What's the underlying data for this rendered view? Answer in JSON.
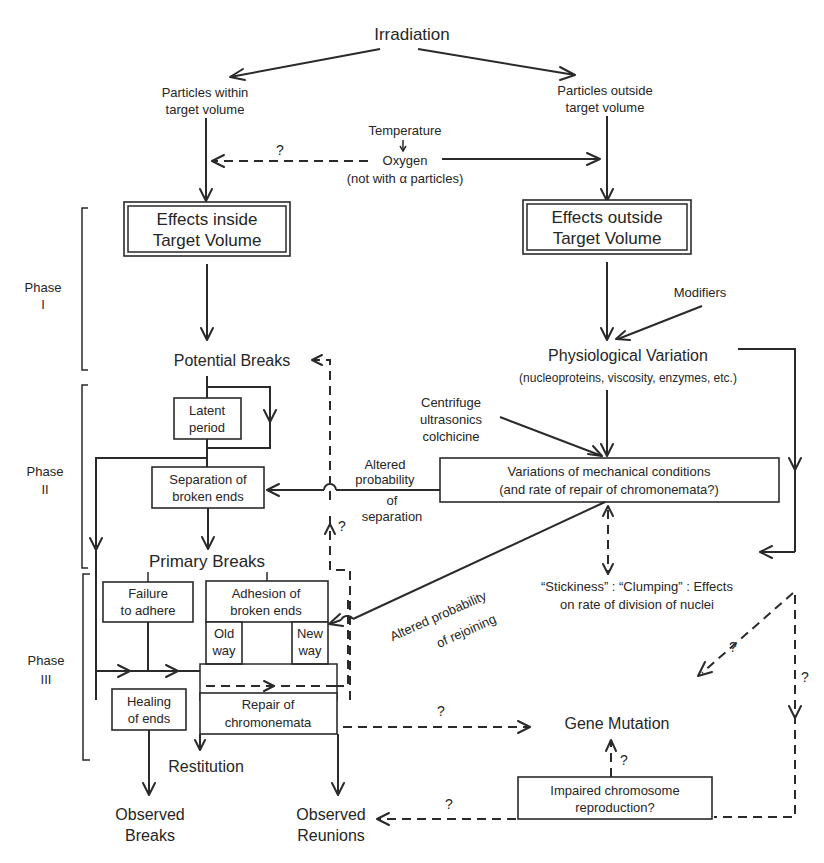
{
  "diagram": {
    "top": {
      "irradiation": "Irradiation",
      "within_1": "Particles within",
      "within_2": "target volume",
      "outside_1": "Particles outside",
      "outside_2": "target volume",
      "temperature": "Temperature",
      "oxygen": "Oxygen",
      "oxygen_note": "(not with α particles)",
      "q_oxygen": "?"
    },
    "effects": {
      "inside_1": "Effects inside",
      "inside_2": "Target Volume",
      "outside_1": "Effects outside",
      "outside_2": "Target Volume"
    },
    "phases": {
      "phase1_a": "Phase",
      "phase1_b": "I",
      "phase2_a": "Phase",
      "phase2_b": "II",
      "phase3_a": "Phase",
      "phase3_b": "III"
    },
    "right": {
      "modifiers": "Modifiers",
      "physio": "Physiological Variation",
      "physio_note": "(nucleoproteins, viscosity, enzymes, etc.)",
      "centrifuge_1": "Centrifuge",
      "centrifuge_2": "ultrasonics",
      "centrifuge_3": "colchicine",
      "mech_1": "Variations of mechanical conditions",
      "mech_2": "(and rate of repair of chromonemata?)",
      "sep_1": "Altered",
      "sep_2": "probability",
      "sep_3": "of",
      "sep_4": "separation",
      "rejoin_1": "Altered probability",
      "rejoin_2": "of rejoining",
      "sticky_1": "“Stickiness” : “Clumping” : Effects",
      "sticky_2": "on rate of division of nuclei",
      "gene": "Gene Mutation",
      "impaired_1": "Impaired chromosome",
      "impaired_2": "reproduction?",
      "q_diag": "?",
      "q_right": "?",
      "q_repair_gene": "?",
      "q_impaired_gene": "?",
      "q_impaired_reunion": "?",
      "q_sep_up": "?"
    },
    "left": {
      "potential": "Potential Breaks",
      "latent_1": "Latent",
      "latent_2": "period",
      "separation_1": "Separation of",
      "separation_2": "broken ends",
      "primary": "Primary Breaks",
      "failure_1": "Failure",
      "failure_2": "to adhere",
      "adhesion_1": "Adhesion of",
      "adhesion_2": "broken ends",
      "old_1": "Old",
      "old_2": "way",
      "new_1": "New",
      "new_2": "way",
      "healing_1": "Healing",
      "healing_2": "of ends",
      "repair_1": "Repair of",
      "repair_2": "chromonemata",
      "restitution": "Restitution",
      "obs_breaks_1": "Observed",
      "obs_breaks_2": "Breaks",
      "obs_reunions_1": "Observed",
      "obs_reunions_2": "Reunions"
    }
  }
}
